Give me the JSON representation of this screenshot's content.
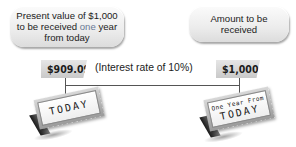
{
  "bubbles": {
    "left": {
      "line1": "Present value of $1,000",
      "line2_pre": "to be received ",
      "line2_em": "one",
      "line2_post": " year",
      "line3": "from today"
    },
    "right": {
      "line1": "Amount to be",
      "line2": "received"
    }
  },
  "tags": {
    "present_value": "$909.09",
    "future_amount": "$1,000"
  },
  "interest_label": "(Interest rate of 10%)",
  "signs": {
    "left": {
      "text": "TODAY"
    },
    "right": {
      "small": "One Year From",
      "big": "TODAY"
    }
  },
  "colors": {
    "emphasis": "#6a7a96",
    "line": "#555555",
    "tag_bg": "#d4d4d4"
  }
}
